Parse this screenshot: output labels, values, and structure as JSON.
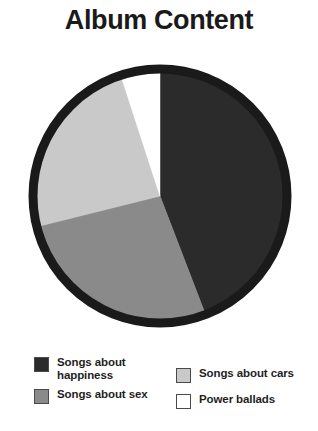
{
  "title": "Album Content",
  "colors": {
    "happiness": "#2b2b2b",
    "sex": "#8a8a8a",
    "cars": "#c9c9c9",
    "power_ballads": "#ffffff",
    "outline": "#1a1a1a",
    "swatch_border": "#4a4a4a",
    "text": "#1f1f1f"
  },
  "legend": {
    "left_column": [
      {
        "label": "Songs about happiness",
        "swatch": "happiness",
        "icon": "legend-swatch-icon"
      },
      {
        "label": "Songs about sex",
        "swatch": "sex",
        "icon": "legend-swatch-icon"
      }
    ],
    "right_column": [
      {
        "label": "Songs about cars",
        "swatch": "cars",
        "icon": "legend-swatch-icon"
      },
      {
        "label": "Power ballads",
        "swatch": "power_ballads",
        "icon": "legend-swatch-icon"
      }
    ]
  },
  "chart_data": {
    "type": "pie",
    "title": "Album Content",
    "xlabel": "",
    "ylabel": "",
    "legend_position": "bottom",
    "grid": false,
    "start_angle_deg": 0,
    "direction": "clockwise",
    "labels": [
      "Songs about happiness",
      "Songs about sex",
      "Songs about cars",
      "Power ballads"
    ],
    "values": [
      44,
      27,
      24,
      5
    ],
    "units": "percent",
    "slices": [
      {
        "label": "Songs about happiness",
        "value": 44,
        "color": "#2b2b2b",
        "start_deg": 0,
        "end_deg": 159
      },
      {
        "label": "Songs about sex",
        "value": 27,
        "color": "#8a8a8a",
        "start_deg": 159,
        "end_deg": 256
      },
      {
        "label": "Songs about cars",
        "value": 24,
        "color": "#c9c9c9",
        "start_deg": 256,
        "end_deg": 342
      },
      {
        "label": "Power ballads",
        "value": 5,
        "color": "#ffffff",
        "start_deg": 342,
        "end_deg": 360
      }
    ]
  }
}
